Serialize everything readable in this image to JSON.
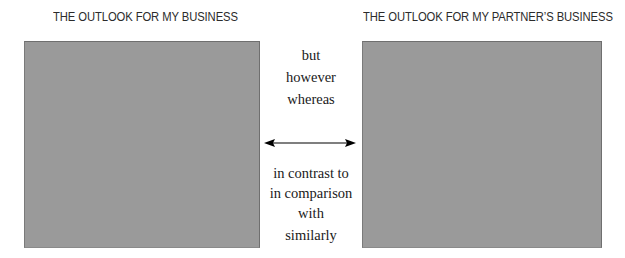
{
  "diagram": {
    "left_panel": {
      "title": "THE OUTLOOK FOR MY BUSINESS",
      "fill_color": "#9a9a9a"
    },
    "right_panel": {
      "title": "THE OUTLOOK FOR MY PARTNER’S BUSINESS",
      "fill_color": "#9a9a9a"
    },
    "connector": {
      "type": "double-headed-arrow",
      "color": "#000000"
    },
    "contrast_words": [
      "but",
      "however",
      "whereas"
    ],
    "comparison_words": [
      "in contrast to",
      "in comparison",
      "with",
      "similarly"
    ]
  }
}
